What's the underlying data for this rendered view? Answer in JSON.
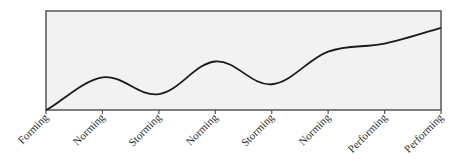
{
  "chart_data": {
    "type": "line",
    "title": "",
    "xlabel": "",
    "ylabel": "",
    "categories": [
      "Forming",
      "Norming",
      "Storming",
      "Norming",
      "Storming",
      "Norming",
      "Performing",
      "Performing"
    ],
    "series": [
      {
        "name": "Team performance",
        "values": [
          0,
          33,
          16,
          49,
          26,
          59,
          67,
          83
        ]
      }
    ],
    "ylim": [
      0,
      100
    ],
    "grid": false,
    "legend": "none",
    "smooth": true,
    "y_axis_ticks": false,
    "plot_background": "#f2f2f2",
    "line_color": "#1a1a1a",
    "frame_color": "#555555"
  }
}
